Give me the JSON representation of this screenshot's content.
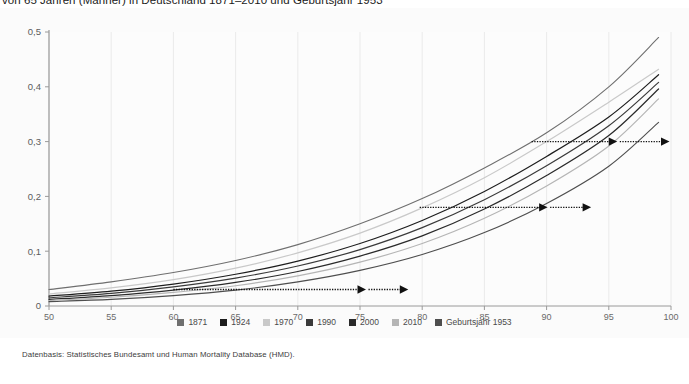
{
  "title": "von 65 Jahren (Männer) in Deutschland 1871–2010 und Geburtsjahr 1953",
  "footer": "Datenbasis: Statistisches Bundesamt und Human Mortality Database (HMD).",
  "legend": {
    "items": [
      {
        "label": "1871",
        "color": "#6f6f6f"
      },
      {
        "label": "1924",
        "color": "#1d1d1d"
      },
      {
        "label": "1970",
        "color": "#c9c9c9"
      },
      {
        "label": "1990",
        "color": "#3a3a3a"
      },
      {
        "label": "2000",
        "color": "#2a2a2a"
      },
      {
        "label": "2010",
        "color": "#b5b5b5"
      },
      {
        "label": "Geburtsjahr 1953",
        "color": "#4e4e4e"
      }
    ]
  },
  "chart_data": {
    "type": "line",
    "title": "von 65 Jahren (Männer) in Deutschland 1871–2010 und Geburtsjahr 1953",
    "xlabel": "",
    "ylabel": "",
    "xlim": [
      50,
      100
    ],
    "ylim": [
      0,
      0.5
    ],
    "xticks": [
      50,
      55,
      60,
      65,
      70,
      75,
      80,
      85,
      90,
      95,
      100
    ],
    "xtick_labels": [
      "50",
      "55",
      "60",
      "65",
      "70",
      "75",
      "80",
      "85",
      "90",
      "95",
      "100"
    ],
    "yticks": [
      0,
      0.1,
      0.2,
      0.3,
      0.4,
      0.5
    ],
    "ytick_labels": [
      "0",
      "0,1",
      "0,2",
      "0,3",
      "0,4",
      "0,5"
    ],
    "grid": "x-only",
    "legend_position": "bottom",
    "x": [
      50,
      55,
      60,
      65,
      70,
      75,
      80,
      85,
      90,
      95,
      99
    ],
    "series": [
      {
        "name": "1871",
        "color": "#6f6f6f",
        "width": 1.1,
        "values": [
          0.03,
          0.044,
          0.061,
          0.083,
          0.112,
          0.15,
          0.196,
          0.252,
          0.316,
          0.4,
          0.49
        ]
      },
      {
        "name": "1924",
        "color": "#1d1d1d",
        "width": 1.2,
        "values": [
          0.018,
          0.027,
          0.04,
          0.058,
          0.082,
          0.114,
          0.156,
          0.209,
          0.273,
          0.345,
          0.422
        ]
      },
      {
        "name": "1970",
        "color": "#c9c9c9",
        "width": 1.2,
        "values": [
          0.022,
          0.033,
          0.048,
          0.069,
          0.097,
          0.133,
          0.179,
          0.234,
          0.3,
          0.372,
          0.432
        ]
      },
      {
        "name": "1990",
        "color": "#3a3a3a",
        "width": 1.2,
        "values": [
          0.015,
          0.023,
          0.035,
          0.051,
          0.073,
          0.103,
          0.143,
          0.194,
          0.256,
          0.329,
          0.408
        ]
      },
      {
        "name": "2000",
        "color": "#2a2a2a",
        "width": 1.2,
        "values": [
          0.012,
          0.019,
          0.029,
          0.043,
          0.063,
          0.091,
          0.128,
          0.177,
          0.238,
          0.311,
          0.396
        ]
      },
      {
        "name": "2010",
        "color": "#b5b5b5",
        "width": 1.2,
        "values": [
          0.01,
          0.016,
          0.025,
          0.037,
          0.055,
          0.08,
          0.114,
          0.16,
          0.219,
          0.292,
          0.378
        ]
      },
      {
        "name": "Geburtsjahr 1953",
        "color": "#4e4e4e",
        "width": 1.1,
        "values": [
          0.008,
          0.012,
          0.019,
          0.029,
          0.044,
          0.065,
          0.094,
          0.134,
          0.187,
          0.255,
          0.335
        ]
      }
    ],
    "annotations": [
      {
        "name": "arrow-low",
        "y": 0.03,
        "x_start": 60.0,
        "x_mid": 75.2,
        "x_end": 78.6
      },
      {
        "name": "arrow-mid",
        "y": 0.18,
        "x_start": 79.8,
        "x_mid": 89.8,
        "x_end": 93.3
      },
      {
        "name": "arrow-high",
        "y": 0.3,
        "x_start": 88.8,
        "x_mid": 95.4,
        "x_end": 99.6
      }
    ]
  }
}
